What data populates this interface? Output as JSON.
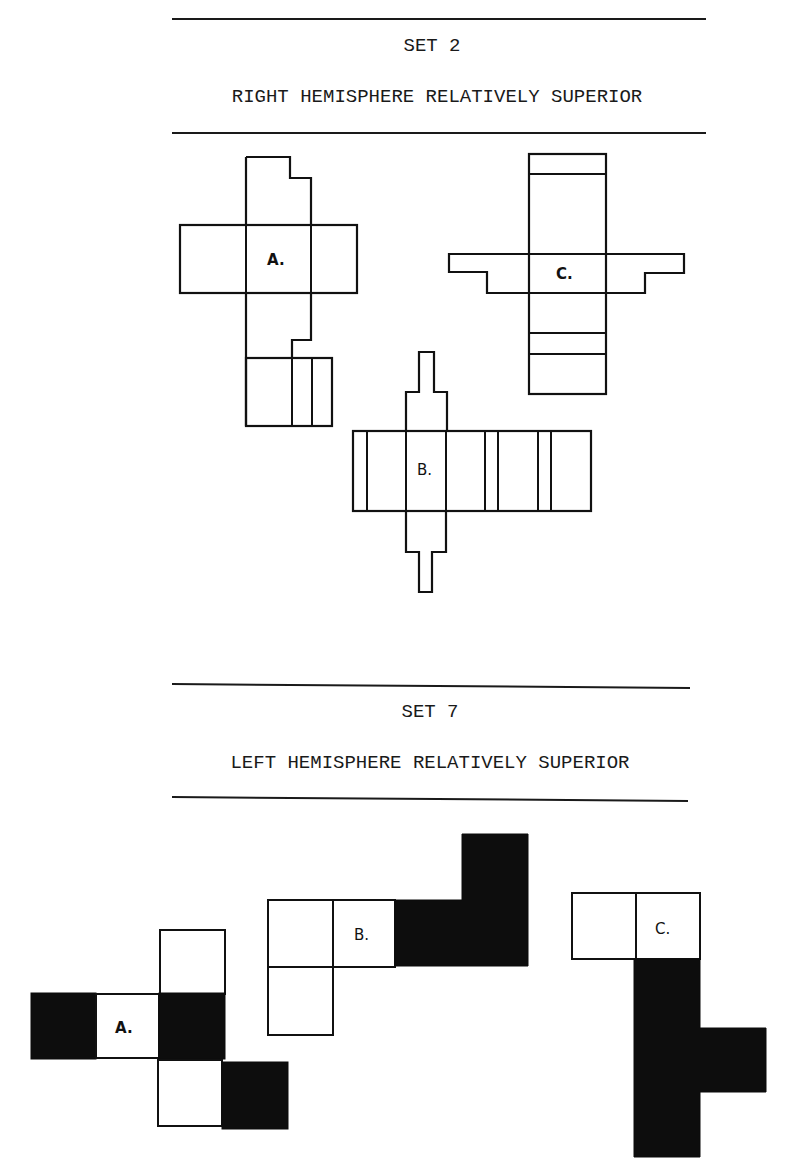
{
  "sets": [
    {
      "title": "SET 2",
      "subtitle": "RIGHT HEMISPHERE RELATIVELY SUPERIOR",
      "figures": [
        {
          "label": "A."
        },
        {
          "label": "B."
        },
        {
          "label": "C."
        }
      ]
    },
    {
      "title": "SET 7",
      "subtitle": "LEFT HEMISPHERE RELATIVELY SUPERIOR",
      "figures": [
        {
          "label": "A."
        },
        {
          "label": "B."
        },
        {
          "label": "C."
        }
      ]
    }
  ]
}
